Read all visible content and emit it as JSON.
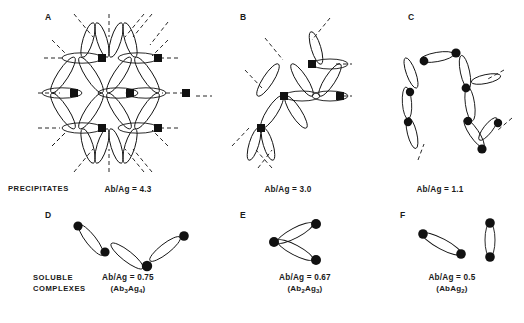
{
  "figure": {
    "row_labels": [
      {
        "id": "precipitates",
        "text": "PRECIPITATES",
        "x": 8,
        "y": 186
      },
      {
        "id": "soluble-complexes",
        "text": "SOLUBLE\nCOMPLEXES",
        "x": 33,
        "y": 279
      }
    ],
    "panels": [
      {
        "id": "A",
        "letter": "A",
        "letter_x": 45,
        "letter_y": 14,
        "ratio_label": "Ab/Ag = 4.3",
        "formula": "",
        "ratio_x": 128,
        "ratio_y": 184,
        "type": "lattice-large",
        "node_count": 9
      },
      {
        "id": "B",
        "letter": "B",
        "letter_x": 240,
        "letter_y": 14,
        "ratio_label": "Ab/Ag = 3.0",
        "formula": "",
        "ratio_x": 288,
        "ratio_y": 184,
        "type": "lattice-small",
        "node_count": 4
      },
      {
        "id": "C",
        "letter": "C",
        "letter_x": 408,
        "letter_y": 14,
        "ratio_label": "Ab/Ag = 1.1",
        "formula": "",
        "ratio_x": 440,
        "ratio_y": 184,
        "type": "chain",
        "node_count": 8
      },
      {
        "id": "D",
        "letter": "D",
        "letter_x": 45,
        "letter_y": 212,
        "ratio_label": "Ab/Ag = 0.75",
        "formula": "(Ab3Ag4)",
        "formula_parts": [
          "(Ab",
          "3",
          "Ag",
          "4",
          ")"
        ],
        "ratio_x": 128,
        "ratio_y": 276,
        "type": "open-chain",
        "node_count": 4
      },
      {
        "id": "E",
        "letter": "E",
        "letter_x": 240,
        "letter_y": 212,
        "ratio_label": "Ab/Ag = 0.67",
        "formula": "(Ab2Ag3)",
        "formula_parts": [
          "(Ab",
          "2",
          "Ag",
          "3",
          ")"
        ],
        "ratio_x": 305,
        "ratio_y": 276,
        "type": "triad",
        "node_count": 3
      },
      {
        "id": "F",
        "letter": "F",
        "letter_x": 400,
        "letter_y": 212,
        "ratio_label": "Ab/Ag = 0.5",
        "formula": "(AbAg2)",
        "formula_parts": [
          "(Ab",
          "",
          "Ag",
          "2",
          ")"
        ],
        "ratio_x": 452,
        "ratio_y": 276,
        "type": "pairs",
        "node_count": 4
      }
    ],
    "colors": {
      "ink": "#1a1a1a",
      "node": "#111111",
      "background": "#ffffff",
      "caption": "#3a3a3a"
    },
    "caption": ""
  }
}
